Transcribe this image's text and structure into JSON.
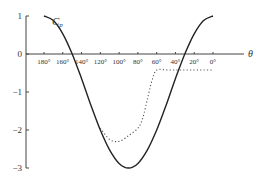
{
  "chart_data": {
    "type": "line",
    "title": "",
    "xlabel": "θ",
    "ylabel": "C_p",
    "x_ticks": [
      "180°",
      "160°",
      "140°",
      "120°",
      "100°",
      "80°",
      "60°",
      "40°",
      "20°",
      "0°"
    ],
    "y_ticks": [
      "1",
      "0",
      "−1",
      "−2",
      "−3"
    ],
    "xlim": [
      180,
      0
    ],
    "ylim": [
      -3,
      1
    ],
    "grid": false,
    "legend": null,
    "annotations": [
      {
        "text": "C_p",
        "near": "top-left of solid curve"
      }
    ],
    "series": [
      {
        "name": "inviscid (solid)",
        "style": "solid",
        "x": [
          180,
          170,
          160,
          150,
          140,
          130,
          120,
          110,
          100,
          90,
          80,
          70,
          60,
          50,
          40,
          30,
          20,
          10,
          0
        ],
        "values": [
          1.0,
          0.88,
          0.53,
          0.0,
          -0.65,
          -1.35,
          -2.0,
          -2.53,
          -2.88,
          -3.0,
          -2.88,
          -2.53,
          -2.0,
          -1.35,
          -0.65,
          0.0,
          0.53,
          0.88,
          1.0
        ]
      },
      {
        "name": "measured (dotted)",
        "style": "dotted",
        "x": [
          180,
          170,
          160,
          150,
          140,
          130,
          120,
          110,
          100,
          90,
          80,
          75,
          70,
          65,
          60,
          50,
          40,
          30,
          20,
          10,
          0
        ],
        "values": [
          1.0,
          0.88,
          0.53,
          0.0,
          -0.65,
          -1.35,
          -1.95,
          -2.25,
          -2.3,
          -2.15,
          -1.95,
          -1.7,
          -1.2,
          -0.7,
          -0.42,
          -0.42,
          -0.42,
          -0.42,
          -0.42,
          -0.42,
          -0.42
        ]
      }
    ]
  },
  "labels": {
    "cp": "C",
    "cp_sub": "p",
    "theta": "θ"
  }
}
